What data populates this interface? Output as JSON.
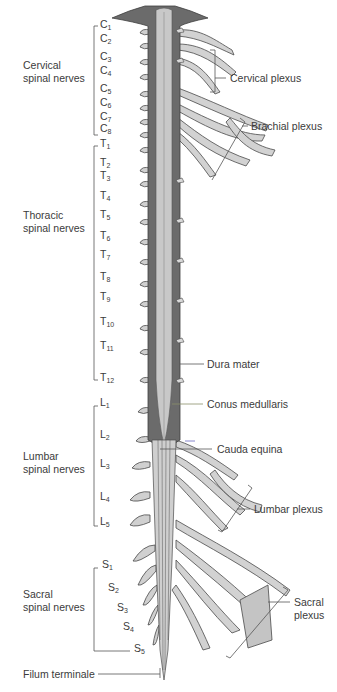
{
  "diagram": {
    "colors": {
      "dura": "#6b6b6b",
      "cord": "#c8c8c8",
      "nerve": "#d4d4d4",
      "outline": "#4a4a4a",
      "text": "#3b3b3b",
      "accent_line": "#8a8f6a"
    },
    "groups": [
      {
        "id": "cervical",
        "line1": "Cervical",
        "line2": "spinal nerves"
      },
      {
        "id": "thoracic",
        "line1": "Thoracic",
        "line2": "spinal nerves"
      },
      {
        "id": "lumbar",
        "line1": "Lumbar",
        "line2": "spinal nerves"
      },
      {
        "id": "sacral",
        "line1": "Sacral",
        "line2": "spinal nerves"
      }
    ],
    "segments": {
      "cervical": [
        {
          "l": "C",
          "n": "1",
          "y": 25
        },
        {
          "l": "C",
          "n": "2",
          "y": 39
        },
        {
          "l": "C",
          "n": "3",
          "y": 57
        },
        {
          "l": "C",
          "n": "4",
          "y": 71
        },
        {
          "l": "C",
          "n": "5",
          "y": 89
        },
        {
          "l": "C",
          "n": "6",
          "y": 103
        },
        {
          "l": "C",
          "n": "7",
          "y": 117
        },
        {
          "l": "C",
          "n": "8",
          "y": 129
        }
      ],
      "thoracic": [
        {
          "l": "T",
          "n": "1",
          "y": 144
        },
        {
          "l": "T",
          "n": "2",
          "y": 163
        },
        {
          "l": "T",
          "n": "3",
          "y": 176
        },
        {
          "l": "T",
          "n": "4",
          "y": 196
        },
        {
          "l": "T",
          "n": "5",
          "y": 215
        },
        {
          "l": "T",
          "n": "6",
          "y": 236
        },
        {
          "l": "T",
          "n": "7",
          "y": 255
        },
        {
          "l": "T",
          "n": "8",
          "y": 277
        },
        {
          "l": "T",
          "n": "9",
          "y": 297
        },
        {
          "l": "T",
          "n": "10",
          "y": 322
        },
        {
          "l": "T",
          "n": "11",
          "y": 346
        },
        {
          "l": "T",
          "n": "12",
          "y": 378
        }
      ],
      "lumbar": [
        {
          "l": "L",
          "n": "1",
          "y": 403
        },
        {
          "l": "L",
          "n": "2",
          "y": 435
        },
        {
          "l": "L",
          "n": "3",
          "y": 464
        },
        {
          "l": "L",
          "n": "4",
          "y": 497
        },
        {
          "l": "L",
          "n": "5",
          "y": 522
        }
      ],
      "sacral": [
        {
          "l": "S",
          "n": "1",
          "y": 565
        },
        {
          "l": "S",
          "n": "2",
          "y": 588
        },
        {
          "l": "S",
          "n": "3",
          "y": 608
        },
        {
          "l": "S",
          "n": "4",
          "y": 627
        },
        {
          "l": "S",
          "n": "5",
          "y": 649
        }
      ]
    },
    "callouts": {
      "cervical_plexus": "Cervical plexus",
      "brachial_plexus": "Brachial plexus",
      "dura_mater": "Dura mater",
      "conus_medullaris": "Conus medullaris",
      "cauda_equina": "Cauda equina",
      "lumbar_plexus": "Lumbar plexus",
      "sacral_plexus_1": "Sacral",
      "sacral_plexus_2": "plexus",
      "filum_terminale": "Filum terminale"
    }
  }
}
